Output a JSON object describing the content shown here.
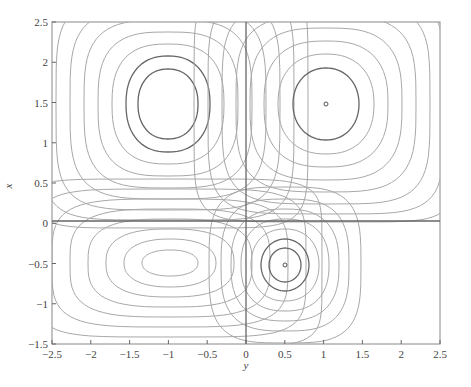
{
  "chart_data": {
    "type": "contour",
    "title": "",
    "xlabel": "y",
    "ylabel": "x",
    "xlim": [
      -2.5,
      2.5
    ],
    "ylim": [
      -1.5,
      2.5
    ],
    "xticks": [
      "-2.5",
      "-2",
      "-1.5",
      "-1",
      "-0.5",
      "0",
      "0.5",
      "1",
      "1.5",
      "2",
      "2.5"
    ],
    "yticks": [
      "2.5",
      "2",
      "1.5",
      "1",
      "0.5",
      "0",
      "-0.5",
      "-1",
      "-1.5"
    ],
    "grid": false,
    "legend": null,
    "separatrices": [
      {
        "orientation": "vertical",
        "at": 0
      },
      {
        "orientation": "horizontal",
        "at": 0
      }
    ],
    "centers": [
      {
        "x": -1.0,
        "y": 1.0,
        "label": "upper-left center"
      },
      {
        "x": 1.0,
        "y": 1.0,
        "label": "upper-right center (small marker)"
      },
      {
        "x": -1.0,
        "y": -0.5,
        "label": "lower-left center (elongated)"
      },
      {
        "x": 0.5,
        "y": -0.5,
        "label": "lower-right center (small marker)"
      }
    ],
    "line_color": "#9a9a9a",
    "highlight_line_color": "#666666",
    "axis_color": "#555555"
  }
}
